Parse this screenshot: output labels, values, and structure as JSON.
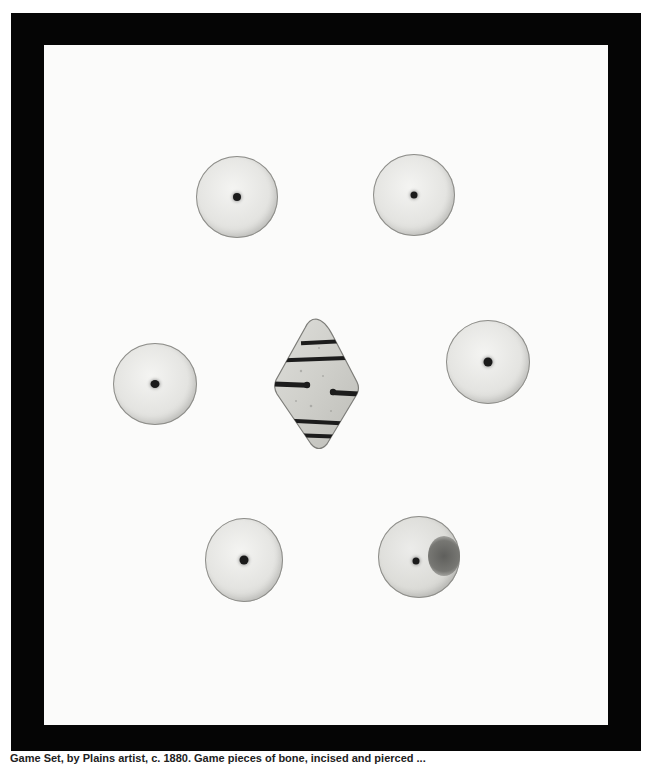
{
  "image": {
    "subject": "Photograph of a bone/shell game set: six pierced discs arranged around a central incised diamond-shaped piece, displayed on a white mat within a black frame",
    "colors": {
      "frame": "#050505",
      "mat": "#fbfbfa",
      "disc_face": "#e4e4e1",
      "disc_edge": "#8d8d89",
      "hole": "#1a1a1a",
      "diamond_face": "#d2d2cd",
      "diamond_stripes": "#1c1c1c"
    },
    "pieces": [
      {
        "type": "disc",
        "position": "top-left",
        "cx": 237,
        "cy": 197,
        "r": 41
      },
      {
        "type": "disc",
        "position": "top-right",
        "cx": 414,
        "cy": 195,
        "r": 41
      },
      {
        "type": "disc",
        "position": "middle-left",
        "cx": 155,
        "cy": 384,
        "r": 42
      },
      {
        "type": "disc",
        "position": "middle-right",
        "cx": 488,
        "cy": 362,
        "r": 42
      },
      {
        "type": "disc",
        "position": "bottom-left",
        "cx": 244,
        "cy": 560,
        "r": 40
      },
      {
        "type": "disc",
        "position": "bottom-right",
        "cx": 419,
        "cy": 557,
        "r": 41,
        "stain": true
      },
      {
        "type": "diamond",
        "position": "center",
        "x": 273,
        "y": 318,
        "w": 86,
        "h": 134,
        "stripes": 6
      }
    ]
  },
  "caption": {
    "text": "Game Set, by Plains artist, c. 1880. Game pieces of bone, incised and pierced ...",
    "truncated": true
  }
}
